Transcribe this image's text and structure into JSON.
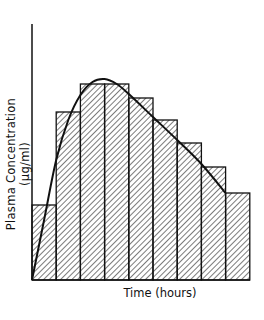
{
  "chart_data": {
    "type": "bar",
    "title": "",
    "xlabel": "Time (hours)",
    "ylabel": "Plasma Concentration (μg/ml)",
    "categories": [
      "1",
      "2",
      "3",
      "4",
      "5",
      "6",
      "7",
      "8",
      "9"
    ],
    "values": [
      75,
      168,
      196,
      196,
      182,
      160,
      137,
      113,
      87
    ],
    "ylim": [
      0,
      256
    ],
    "grid": false,
    "bar_fill": "diagonal hatch",
    "overlay_curve": {
      "description": "smooth concentration-time curve rising from origin to peak then declining linearly",
      "points": [
        [
          0,
          0
        ],
        [
          0.5,
          60
        ],
        [
          1,
          120
        ],
        [
          1.5,
          160
        ],
        [
          2,
          185
        ],
        [
          2.5,
          198
        ],
        [
          3,
          201
        ],
        [
          3.5,
          196
        ],
        [
          4,
          186
        ],
        [
          5,
          163
        ],
        [
          6,
          140
        ],
        [
          7,
          116
        ],
        [
          8,
          87
        ]
      ]
    }
  },
  "labels": {
    "xlabel": "Time (hours)",
    "ylabel": "Plasma Concentration (μg/ml)"
  }
}
